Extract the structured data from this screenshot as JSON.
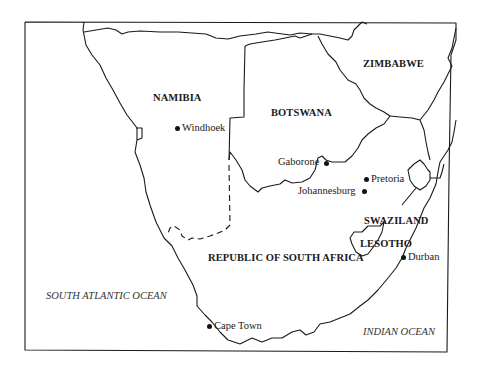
{
  "map": {
    "countries": [
      {
        "id": "namibia",
        "label": "NAMIBIA"
      },
      {
        "id": "botswana",
        "label": "BOTSWANA"
      },
      {
        "id": "zimbabwe",
        "label": "ZIMBABWE"
      },
      {
        "id": "swaziland",
        "label": "SWAZILAND"
      },
      {
        "id": "lesotho",
        "label": "LESOTHO"
      },
      {
        "id": "south-africa",
        "label": "REPUBLIC OF SOUTH AFRICA"
      }
    ],
    "cities": [
      {
        "id": "windhoek",
        "label": "Windhoek"
      },
      {
        "id": "gaborone",
        "label": "Gaborone"
      },
      {
        "id": "pretoria",
        "label": "Pretoria"
      },
      {
        "id": "johannesburg",
        "label": "Johannesburg"
      },
      {
        "id": "durban",
        "label": "Durban"
      },
      {
        "id": "cape-town",
        "label": "Cape Town"
      }
    ],
    "oceans": [
      {
        "id": "south-atlantic",
        "label": "SOUTH ATLANTIC OCEAN"
      },
      {
        "id": "indian",
        "label": "INDIAN OCEAN"
      }
    ],
    "colors": {
      "line": "#1a1a1a",
      "background": "#ffffff"
    }
  }
}
